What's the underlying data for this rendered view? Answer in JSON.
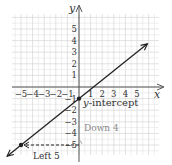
{
  "chart_data": {
    "type": "line",
    "title": "",
    "xlabel": "x",
    "ylabel": "y",
    "xlim": [
      -6,
      6.5
    ],
    "ylim": [
      -6,
      6.5
    ],
    "grid": true,
    "x_ticks": [
      -5,
      -4,
      -3,
      -2,
      -1,
      1,
      2,
      3,
      4,
      5
    ],
    "y_ticks": [
      -5,
      -4,
      -3,
      -2,
      -1,
      1,
      2,
      3,
      4,
      5
    ],
    "x_tick_labels": [
      "−5",
      "−4",
      "−3",
      "−2",
      "−1",
      "1",
      "2",
      "3",
      "4",
      "5"
    ],
    "y_tick_labels": [
      "−5",
      "−4",
      "−3",
      "−2",
      "−1",
      "1",
      "2",
      "3",
      "4",
      "5"
    ],
    "series": [
      {
        "name": "line",
        "slope": 0.8,
        "intercept": -1,
        "x": [
          -6,
          6
        ],
        "y": [
          -5.8,
          3.8
        ]
      }
    ],
    "points": [
      {
        "name": "y-intercept",
        "x": 0,
        "y": -1
      },
      {
        "name": "point",
        "x": -5,
        "y": -5
      }
    ],
    "annotations": [
      {
        "text": "y-intercept",
        "x": 0.2,
        "y": -1.5
      },
      {
        "text": "Down 4",
        "x": 1.0,
        "y": -3.9
      },
      {
        "text": "Left 5",
        "x": -4.0,
        "y": -5.8
      }
    ]
  },
  "labels": {
    "x_axis": "x",
    "y_axis": "y",
    "y_intercept": "-intercept",
    "y_intercept_var": "y",
    "down": "Down 4",
    "left": "Left 5"
  },
  "colors": {
    "grid": "#d6d6d6",
    "axis": "#555555",
    "line": "#222222",
    "annotation_gray": "#8a8a8a",
    "text": "#333333"
  }
}
